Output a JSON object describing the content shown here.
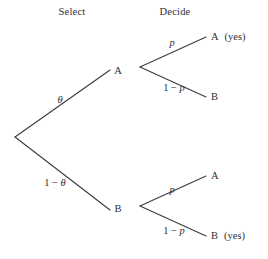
{
  "diagram": {
    "type": "decision-tree",
    "background_color": "#ffffff",
    "line_color": "#3a3a40",
    "text_color": "#2e2e33",
    "headers": [
      {
        "key": "select",
        "label": "Select",
        "x": 72,
        "y": 12
      },
      {
        "key": "decide",
        "label": "Decide",
        "x": 175,
        "y": 12
      }
    ],
    "nodes": [
      {
        "key": "root",
        "label": "",
        "x": 15,
        "y": 137
      },
      {
        "key": "stage1-a",
        "label": "A",
        "x": 118,
        "y": 71
      },
      {
        "key": "stage1-b",
        "label": "B",
        "x": 118,
        "y": 209
      },
      {
        "key": "fork-upper",
        "label": "",
        "x": 140,
        "y": 67
      },
      {
        "key": "fork-lower",
        "label": "",
        "x": 140,
        "y": 206
      }
    ],
    "terminals": [
      {
        "key": "terminal-a-yes",
        "label": "A",
        "note": "(yes)",
        "x": 211,
        "y": 37
      },
      {
        "key": "terminal-a-b",
        "label": "B",
        "note": "",
        "x": 211,
        "y": 97
      },
      {
        "key": "terminal-b-a",
        "label": "A",
        "note": "",
        "x": 211,
        "y": 176
      },
      {
        "key": "terminal-b-yes",
        "label": "B",
        "note": "(yes)",
        "x": 211,
        "y": 236
      }
    ],
    "edges": [
      {
        "key": "edge-root-a",
        "x1": 15,
        "y1": 137,
        "x2": 110,
        "y2": 70
      },
      {
        "key": "edge-root-b",
        "x1": 15,
        "y1": 137,
        "x2": 110,
        "y2": 210
      },
      {
        "key": "edge-a-upper",
        "x1": 140,
        "y1": 67,
        "x2": 206,
        "y2": 37
      },
      {
        "key": "edge-a-lower",
        "x1": 140,
        "y1": 67,
        "x2": 206,
        "y2": 97
      },
      {
        "key": "edge-b-upper",
        "x1": 140,
        "y1": 206,
        "x2": 206,
        "y2": 176
      },
      {
        "key": "edge-b-lower",
        "x1": 140,
        "y1": 206,
        "x2": 206,
        "y2": 236
      }
    ],
    "edge_labels": [
      {
        "key": "prob-theta",
        "prefix": "",
        "op": "",
        "symbol": "θ",
        "x": 60,
        "y": 100
      },
      {
        "key": "prob-one-minus-theta",
        "prefix": "1",
        "op": "−",
        "symbol": "θ",
        "x": 55,
        "y": 183
      },
      {
        "key": "prob-p-upper",
        "prefix": "",
        "op": "",
        "symbol": "p",
        "x": 172,
        "y": 43
      },
      {
        "key": "prob-one-minus-p-upper",
        "prefix": "1",
        "op": "−",
        "symbol": "p",
        "x": 174,
        "y": 88
      },
      {
        "key": "prob-p-lower",
        "prefix": "",
        "op": "",
        "symbol": "p",
        "x": 172,
        "y": 190
      },
      {
        "key": "prob-one-minus-p-lower",
        "prefix": "1",
        "op": "−",
        "symbol": "p",
        "x": 174,
        "y": 231
      }
    ]
  }
}
